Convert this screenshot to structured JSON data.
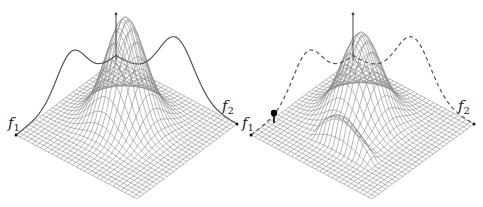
{
  "figure": {
    "panels": [
      {
        "id": "left",
        "description": "Wireframe surface over (f1, f2) plane with a single central peak; solid profile curve drawn above the back edges",
        "axis_labels": {
          "x": {
            "base": "f",
            "sub": "1"
          },
          "y": {
            "base": "f",
            "sub": "2"
          }
        },
        "profile_style": "solid",
        "surface": {
          "peaks": [
            {
              "u": 0.45,
              "v": 0.45,
              "height": 1.0,
              "width": 0.13
            }
          ],
          "ridge": null
        },
        "marker": null
      },
      {
        "id": "right",
        "description": "Wireframe surface with central peak and a shaded ridge running toward the front; dashed profile curve drawn above the back edges; black point marker near f1 edge",
        "axis_labels": {
          "x": {
            "base": "f",
            "sub": "1"
          },
          "y": {
            "base": "f",
            "sub": "2"
          }
        },
        "profile_style": "dashed",
        "surface": {
          "peaks": [
            {
              "u": 0.42,
              "v": 0.42,
              "height": 0.9,
              "width": 0.13
            }
          ],
          "ridge": {
            "u": 0.72,
            "from_v": 0.3,
            "to_v": 0.8,
            "height": 0.28
          }
        },
        "marker": {
          "shape": "filled-circle-on-stem",
          "color": "#000000"
        }
      }
    ],
    "colors": {
      "mesh": "#8a8a8a",
      "curve": "#555555",
      "axis": "#444444",
      "label": "#222222",
      "background": "#ffffff"
    }
  }
}
